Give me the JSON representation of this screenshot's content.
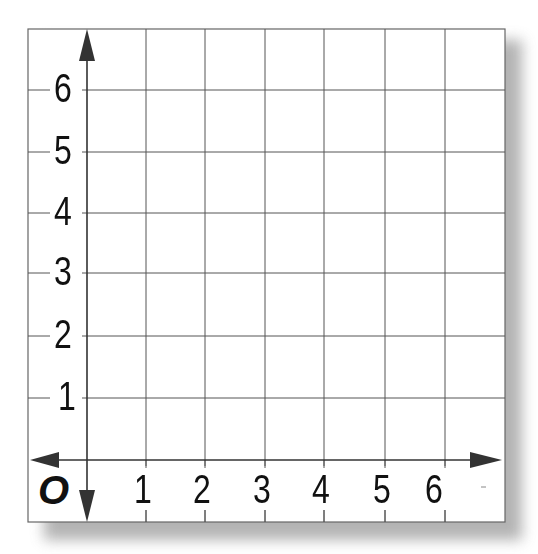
{
  "diagram": {
    "type": "coordinate-grid",
    "origin_label": "O",
    "x_axis": {
      "tick_labels": [
        "1",
        "2",
        "3",
        "4",
        "5",
        "6"
      ],
      "arrows": [
        "left",
        "right"
      ]
    },
    "y_axis": {
      "tick_labels": [
        "1",
        "2",
        "3",
        "4",
        "5",
        "6"
      ],
      "arrows": [
        "up",
        "down"
      ]
    },
    "grid": {
      "columns": 8,
      "rows": 8,
      "line_color": "#555555",
      "axis_color": "#333333",
      "background": "#ffffff"
    }
  }
}
